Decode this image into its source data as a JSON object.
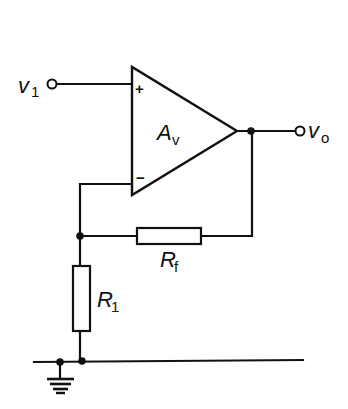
{
  "diagram": {
    "colors": {
      "ink": "#111111",
      "background": "#ffffff"
    },
    "labels": {
      "input": {
        "main": "v",
        "sub": "1"
      },
      "output": {
        "main": "v",
        "sub": "o"
      },
      "gain": {
        "main": "A",
        "sub": "v"
      },
      "feedback_resistor": {
        "main": "R",
        "sub": "f"
      },
      "ground_resistor": {
        "main": "R",
        "sub": "1"
      },
      "plus_sign": "+",
      "minus_sign": "−"
    },
    "components": [
      {
        "id": "op-amp",
        "type": "operational-amplifier",
        "label": "Av"
      },
      {
        "id": "rf",
        "type": "resistor",
        "label": "Rf"
      },
      {
        "id": "r1",
        "type": "resistor",
        "label": "R1"
      },
      {
        "id": "gnd",
        "type": "ground"
      },
      {
        "id": "in-terminal",
        "type": "terminal",
        "label": "v1"
      },
      {
        "id": "out-terminal",
        "type": "terminal",
        "label": "vo"
      }
    ]
  }
}
